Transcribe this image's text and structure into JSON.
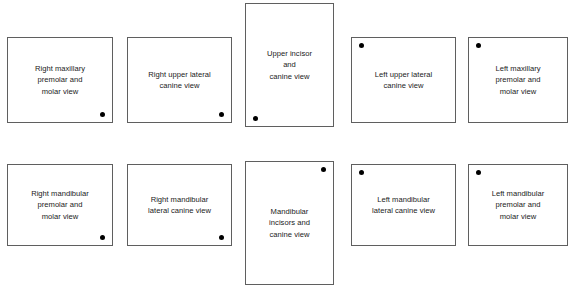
{
  "mount": {
    "title": "Full mouth radiographic series mount",
    "background_color": "#ffffff",
    "border_color": "#5f5f5f",
    "dot_color": "#000000",
    "text_color": "#1a1a1a",
    "films": [
      {
        "id": "right-maxillary-premolar-molar",
        "label": "Right maxillary\npremolar and\nmolar view",
        "dot_position": "bottom-right",
        "x": 7,
        "y": 37,
        "w": 106,
        "h": 86
      },
      {
        "id": "right-upper-lateral-canine",
        "label": "Right upper lateral\ncanine view",
        "dot_position": "bottom-right",
        "x": 127,
        "y": 37,
        "w": 105,
        "h": 86
      },
      {
        "id": "upper-incisor-canine",
        "label": "Upper incisor\nand\ncanine view",
        "dot_position": "bottom-left",
        "x": 245,
        "y": 3,
        "w": 89,
        "h": 124
      },
      {
        "id": "left-upper-lateral-canine",
        "label": "Left upper lateral\ncanine view",
        "dot_position": "top-left",
        "x": 351,
        "y": 37,
        "w": 105,
        "h": 86
      },
      {
        "id": "left-maxillary-premolar-molar",
        "label": "Left maxillary\npremolar and\nmolar view",
        "dot_position": "top-left",
        "x": 468,
        "y": 37,
        "w": 100,
        "h": 86
      },
      {
        "id": "right-mandibular-premolar-molar",
        "label": "Right mandibular\npremolar and\nmolar view",
        "dot_position": "bottom-right",
        "x": 7,
        "y": 164,
        "w": 106,
        "h": 82
      },
      {
        "id": "right-mandibular-lateral-canine",
        "label": "Right mandibular\nlateral canine view",
        "dot_position": "bottom-right",
        "x": 127,
        "y": 164,
        "w": 105,
        "h": 82
      },
      {
        "id": "mandibular-incisors-canine",
        "label": "Mandibular\nincisors and\ncanine view",
        "dot_position": "top-right",
        "x": 245,
        "y": 161,
        "w": 89,
        "h": 124
      },
      {
        "id": "left-mandibular-lateral-canine",
        "label": "Left mandibular\nlateral canine view",
        "dot_position": "top-left",
        "x": 351,
        "y": 164,
        "w": 105,
        "h": 82
      },
      {
        "id": "left-mandibular-premolar-molar",
        "label": "Left mandibular\npremolar and\nmolar view",
        "dot_position": "top-left",
        "x": 468,
        "y": 164,
        "w": 100,
        "h": 82
      }
    ]
  }
}
